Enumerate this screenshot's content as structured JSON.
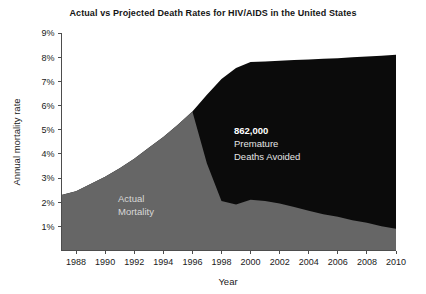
{
  "chart_data": {
    "type": "area",
    "title": "Actual vs Projected Death Rates for HIV/AIDS in the United States",
    "xlabel": "Year",
    "ylabel": "Annual mortality rate",
    "xlim": [
      1987,
      2010
    ],
    "ylim": [
      0,
      9
    ],
    "grid": false,
    "legend_position": "inline-annotation",
    "y_ticks": [
      "1%",
      "2%",
      "3%",
      "4%",
      "5%",
      "6%",
      "7%",
      "8%",
      "9%"
    ],
    "y_tick_values": [
      1,
      2,
      3,
      4,
      5,
      6,
      7,
      8,
      9
    ],
    "x_ticks": [
      "1988",
      "1990",
      "1992",
      "1994",
      "1996",
      "1998",
      "2000",
      "2002",
      "2004",
      "2006",
      "2008",
      "2010"
    ],
    "x_tick_values": [
      1988,
      1990,
      1992,
      1994,
      1996,
      1998,
      2000,
      2002,
      2004,
      2006,
      2008,
      2010
    ],
    "x": [
      1987,
      1988,
      1989,
      1990,
      1991,
      1992,
      1993,
      1994,
      1995,
      1996,
      1997,
      1998,
      1999,
      2000,
      2001,
      2002,
      2003,
      2004,
      2005,
      2006,
      2007,
      2008,
      2009,
      2010
    ],
    "series": [
      {
        "name": "Actual Mortality",
        "color": "#666666",
        "values": [
          2.3,
          2.45,
          2.75,
          3.05,
          3.4,
          3.8,
          4.25,
          4.7,
          5.2,
          5.75,
          3.6,
          2.05,
          1.9,
          2.1,
          2.05,
          1.95,
          1.8,
          1.65,
          1.5,
          1.4,
          1.25,
          1.15,
          1.0,
          0.9
        ]
      },
      {
        "name": "Projected Mortality",
        "color": "#0b0b0b",
        "values": [
          2.3,
          2.45,
          2.75,
          3.05,
          3.4,
          3.8,
          4.25,
          4.7,
          5.2,
          5.75,
          6.45,
          7.1,
          7.55,
          7.8,
          7.82,
          7.85,
          7.88,
          7.9,
          7.93,
          7.96,
          8.0,
          8.03,
          8.06,
          8.1
        ]
      }
    ],
    "annotations": [
      {
        "name": "premature-deaths-avoided",
        "lines": [
          "862,000",
          "Premature",
          "Deaths Avoided"
        ],
        "value": "862,000",
        "x": 2000,
        "y": 4.6
      },
      {
        "name": "actual-mortality-label",
        "lines": [
          "Actual",
          "Mortality"
        ],
        "x": 1993.5,
        "y": 1.85
      }
    ]
  },
  "axis": {
    "y_title": "Annual mortality rate",
    "x_title": "Year"
  }
}
